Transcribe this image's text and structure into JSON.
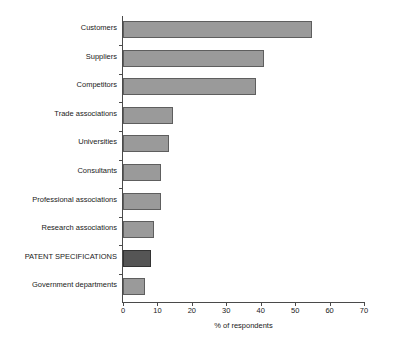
{
  "chart_data": {
    "type": "bar",
    "orientation": "horizontal",
    "title": "",
    "subtitle": "",
    "xlabel": "% of respondents",
    "ylabel": "",
    "xlim": [
      0,
      70
    ],
    "ylim": null,
    "grid": false,
    "legend": null,
    "xticks": [
      "0",
      "10",
      "20",
      "30",
      "40",
      "50",
      "60",
      "70"
    ],
    "xtick_values": [
      0,
      10,
      20,
      30,
      40,
      50,
      60,
      70
    ],
    "categories": [
      "Customers",
      "Suppliers",
      "Competitors",
      "Trade associations",
      "Universities",
      "Consultants",
      "Professional associations",
      "Research associations",
      "PATENT SPECIFICATIONS",
      "Government departments"
    ],
    "values": [
      55.0,
      41.0,
      38.5,
      14.5,
      13.5,
      11.0,
      11.0,
      9.0,
      8.0,
      6.5
    ],
    "highlight_category": "PATENT SPECIFICATIONS",
    "colors": {
      "bar_fill": "#9a9a9a",
      "bar_edge": "#5e5e5e",
      "highlight_fill": "#555555",
      "highlight_edge": "#333333",
      "axis": "#4a4a4a",
      "text": "#1a1a1a",
      "background": "#ffffff"
    }
  }
}
